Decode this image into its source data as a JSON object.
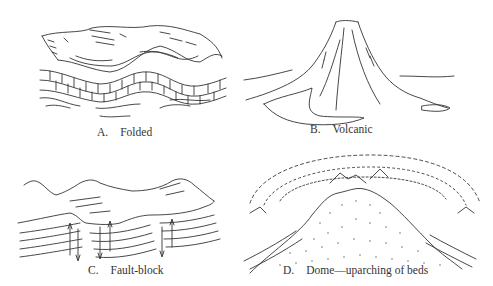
{
  "figure": {
    "panels": [
      {
        "id": "A",
        "letter": "A.",
        "title": "Folded"
      },
      {
        "id": "B",
        "letter": "B.",
        "title": "Volcanic"
      },
      {
        "id": "C",
        "letter": "C.",
        "title": "Fault-block"
      },
      {
        "id": "D",
        "letter": "D.",
        "title": "Dome—uparching of beds"
      }
    ]
  }
}
